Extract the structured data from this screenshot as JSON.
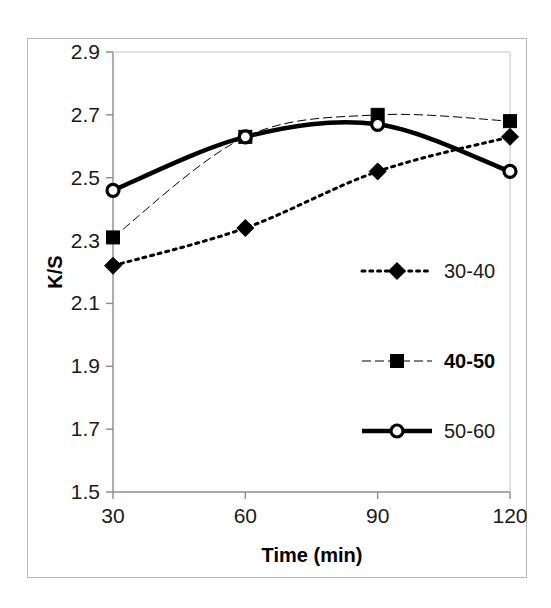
{
  "chart_data": {
    "type": "line",
    "title": "",
    "xlabel": "Time (min)",
    "ylabel": "K/S",
    "x": [
      30,
      60,
      90,
      120
    ],
    "xtick_labels": [
      "30",
      "60",
      "90",
      "120"
    ],
    "ytick_labels": [
      "1.5",
      "1.7",
      "1.9",
      "2.1",
      "2.3",
      "2.5",
      "2.7",
      "2.9"
    ],
    "yticks": [
      1.5,
      1.7,
      1.9,
      2.1,
      2.3,
      2.5,
      2.7,
      2.9
    ],
    "xlim": [
      30,
      120
    ],
    "ylim": [
      1.5,
      2.9
    ],
    "grid": false,
    "legend_position": "inside-right",
    "series": [
      {
        "name": "30-40",
        "values": [
          2.22,
          2.34,
          2.52,
          2.63
        ],
        "marker": "filled-diamond",
        "linestyle": "dotted",
        "linewidth": 3,
        "color": "#000000",
        "label_bold": false
      },
      {
        "name": "40-50",
        "values": [
          2.31,
          2.63,
          2.7,
          2.68
        ],
        "marker": "filled-square",
        "linestyle": "dashdot-thin",
        "linewidth": 1,
        "color": "#000000",
        "label_bold": true
      },
      {
        "name": "50-60",
        "values": [
          2.46,
          2.63,
          2.67,
          2.52
        ],
        "marker": "open-circle",
        "linestyle": "solid",
        "linewidth": 4.5,
        "color": "#000000",
        "label_bold": false
      }
    ]
  },
  "axes": {
    "y_label_text": "K/S",
    "x_label_text": "Time (min)",
    "axis_color": "#8c8c8c",
    "frame_color": "#b9b9b9"
  },
  "legend": {
    "entries": [
      {
        "label": "30-40"
      },
      {
        "label": "40-50"
      },
      {
        "label": "50-60"
      }
    ]
  }
}
